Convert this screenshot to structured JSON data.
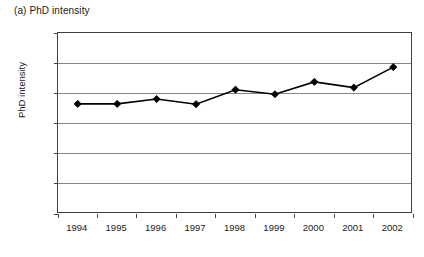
{
  "figure": {
    "title": "(a) PhD intensity",
    "background_color": "#ffffff",
    "frame_color": "#404040",
    "gridline_color": "#868686",
    "series_color": "#000000"
  },
  "chart_data": {
    "type": "line",
    "title": "(a) PhD intensity",
    "xlabel": "",
    "ylabel": "PhD intensity",
    "categories": [
      "1994",
      "1995",
      "1996",
      "1997",
      "1998",
      "1999",
      "2000",
      "2001",
      "2002"
    ],
    "values": [
      0.0365,
      0.0365,
      0.0381,
      0.0364,
      0.0412,
      0.0397,
      0.0438,
      0.0419,
      0.0487
    ],
    "series": [
      {
        "name": "PhD intensity",
        "values": [
          0.0365,
          0.0365,
          0.0381,
          0.0364,
          0.0412,
          0.0397,
          0.0438,
          0.0419,
          0.0487
        ],
        "color": "#000000",
        "marker": "diamond",
        "line_style": "solid"
      }
    ],
    "ylim": [
      0,
      0.06
    ],
    "yticks": [
      0,
      0.01,
      0.02,
      0.03,
      0.04,
      0.05,
      0.06
    ],
    "ytick_labels": [
      "0",
      "0.01",
      "0.02",
      "0.03",
      "0.04",
      "0.05",
      "0.06"
    ],
    "xtick_labels": [
      "1994",
      "1995",
      "1996",
      "1997",
      "1998",
      "1999",
      "2000",
      "2001",
      "2002"
    ],
    "grid": true,
    "grid_axis": "y",
    "legend": false,
    "legend_position": "none"
  }
}
